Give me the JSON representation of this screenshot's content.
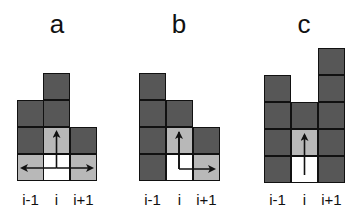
{
  "colors": {
    "blocked": "#575757",
    "reachable": "#b8b8b8",
    "current": "#ffffff",
    "border": "#111111"
  },
  "column_labels": [
    "i-1",
    "i",
    "i+1"
  ],
  "panels": [
    {
      "id": "a",
      "title": "a",
      "columns": [
        {
          "label": "i-1",
          "cells_bottom_up": [
            "gray",
            "dark",
            "dark"
          ]
        },
        {
          "label": "i",
          "cells_bottom_up": [
            "white",
            "gray",
            "dark",
            "dark"
          ]
        },
        {
          "label": "i+1",
          "cells_bottom_up": [
            "gray",
            "dark"
          ]
        }
      ],
      "arrows": [
        "up",
        "left",
        "right"
      ]
    },
    {
      "id": "b",
      "title": "b",
      "columns": [
        {
          "label": "i-1",
          "cells_bottom_up": [
            "dark",
            "dark",
            "dark",
            "dark"
          ]
        },
        {
          "label": "i",
          "cells_bottom_up": [
            "white",
            "gray",
            "dark"
          ]
        },
        {
          "label": "i+1",
          "cells_bottom_up": [
            "gray",
            "dark"
          ]
        }
      ],
      "arrows": [
        "up",
        "right"
      ]
    },
    {
      "id": "c",
      "title": "c",
      "columns": [
        {
          "label": "i-1",
          "cells_bottom_up": [
            "dark",
            "dark",
            "dark",
            "dark"
          ]
        },
        {
          "label": "i",
          "cells_bottom_up": [
            "white",
            "gray",
            "dark"
          ]
        },
        {
          "label": "i+1",
          "cells_bottom_up": [
            "dark",
            "dark",
            "dark",
            "dark",
            "dark"
          ]
        }
      ],
      "arrows": [
        "up"
      ]
    }
  ]
}
